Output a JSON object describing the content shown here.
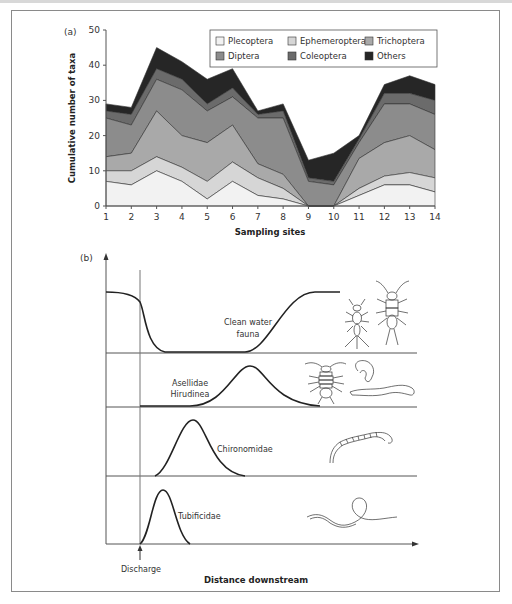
{
  "chart_data": [
    {
      "panel_label": "(a)",
      "type": "area",
      "stacked": true,
      "title": "",
      "xlabel": "Sampling sites",
      "ylabel": "Cumulative number of taxa",
      "x": [
        1,
        2,
        3,
        4,
        5,
        6,
        7,
        8,
        9,
        10,
        11,
        12,
        13,
        14
      ],
      "xticks": [
        "1",
        "2",
        "3",
        "4",
        "5",
        "6",
        "7",
        "8",
        "9",
        "10",
        "11",
        "12",
        "13",
        "14"
      ],
      "yticks": [
        "0",
        "10",
        "20",
        "30",
        "40",
        "50"
      ],
      "ylim": [
        0,
        50
      ],
      "grid": false,
      "legend_position": "top-right",
      "cumulative_series": [
        {
          "name": "Plecoptera",
          "color": "#f2f2f2",
          "values": [
            7,
            6,
            10,
            7,
            2,
            7,
            3,
            2,
            0,
            0,
            3,
            6,
            6,
            4
          ]
        },
        {
          "name": "Ephemeroptera",
          "color": "#d6d6d6",
          "values": [
            10,
            10,
            14,
            11,
            7,
            12.5,
            8,
            5,
            0,
            0,
            5,
            8.5,
            9.5,
            8
          ]
        },
        {
          "name": "Trichoptera",
          "color": "#a9a9a9",
          "values": [
            14,
            15,
            27,
            20,
            18,
            23,
            12,
            9,
            0,
            0,
            13.5,
            18,
            20,
            16
          ]
        },
        {
          "name": "Diptera",
          "color": "#8c8c8c",
          "values": [
            25,
            23,
            36,
            33,
            27,
            31,
            25,
            25,
            7,
            6,
            18,
            29,
            29,
            26
          ]
        },
        {
          "name": "Coleoptera",
          "color": "#6b6b6b",
          "values": [
            27,
            26,
            39,
            36,
            29,
            33.5,
            26,
            27,
            8,
            7,
            19,
            32,
            32,
            30
          ]
        },
        {
          "name": "Others",
          "color": "#262626",
          "values": [
            29,
            28,
            45,
            41,
            36,
            39,
            27,
            29,
            13,
            15,
            20,
            34.5,
            37,
            34.5
          ]
        }
      ]
    },
    {
      "panel_label": "(b)",
      "type": "diagram",
      "xlabel": "Distance downstream",
      "marker_label": "Discharge",
      "rows": [
        {
          "name": "Clean water fauna",
          "label_lines": [
            "Clean water",
            "fauna"
          ],
          "pattern": "decline-then-recovery"
        },
        {
          "name": "Asellidae Hirudinea",
          "label_lines": [
            "Asellidae",
            "Hirudinea"
          ],
          "pattern": "peak-far"
        },
        {
          "name": "Chironomidae",
          "label_lines": [
            "Chironomidae"
          ],
          "pattern": "peak-mid"
        },
        {
          "name": "Tubificidae",
          "label_lines": [
            "Tubificidae"
          ],
          "pattern": "peak-near"
        }
      ]
    }
  ],
  "legend": {
    "items": [
      "Plecoptera",
      "Ephemeroptera",
      "Trichoptera",
      "Diptera",
      "Coleoptera",
      "Others"
    ]
  }
}
